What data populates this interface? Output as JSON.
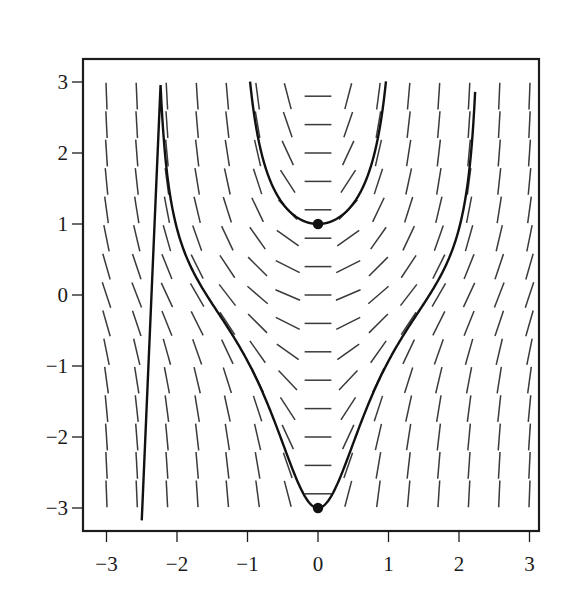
{
  "chart_data": {
    "type": "slope_field",
    "title": "",
    "xlabel": "",
    "ylabel": "",
    "xlim": [
      -3.15,
      3.15
    ],
    "ylim": [
      -3.15,
      3.25
    ],
    "x_ticks": [
      -3,
      -2,
      -1,
      0,
      1,
      2,
      3
    ],
    "y_ticks": [
      -3,
      -2,
      -1,
      0,
      1,
      2,
      3
    ],
    "x_tick_labels": [
      "−3",
      "−2",
      "−1",
      "0",
      "1",
      "2",
      "3"
    ],
    "y_tick_labels": [
      "−3",
      "−2",
      "−1",
      "0",
      "1",
      "2",
      "3"
    ],
    "grid": false,
    "legend": null,
    "field": {
      "equation": "dy/dx = x(1 + y^2)",
      "x_values": [
        -3,
        -2.571,
        -2.143,
        -1.714,
        -1.286,
        -0.857,
        -0.429,
        0,
        0.429,
        0.857,
        1.286,
        1.714,
        2.143,
        2.571,
        3
      ],
      "y_values": [
        2.8,
        2.4,
        2.0,
        1.6,
        1.2,
        0.8,
        0.4,
        0,
        -0.4,
        -0.8,
        -1.2,
        -1.6,
        -2.0,
        -2.4,
        -2.8
      ],
      "segment_length": 0.38
    },
    "solution_curves": [
      {
        "name": "upper",
        "initial_point": [
          0,
          1
        ],
        "formula": "y = tan(x^2/2 + pi/4)",
        "x_range": [
          -1.15,
          0.98
        ]
      },
      {
        "name": "lower",
        "initial_point": [
          0,
          -3
        ],
        "formula": "y = tan(x^2/2 - arctan 3)",
        "x_range": [
          -2.5,
          2.35
        ]
      }
    ],
    "marked_points": [
      [
        0,
        1
      ],
      [
        0,
        -3
      ]
    ]
  },
  "colors": {
    "frame": "#1c1c1c",
    "segments": "#3a3a3a",
    "curves": "#111111",
    "points": "#111111"
  }
}
